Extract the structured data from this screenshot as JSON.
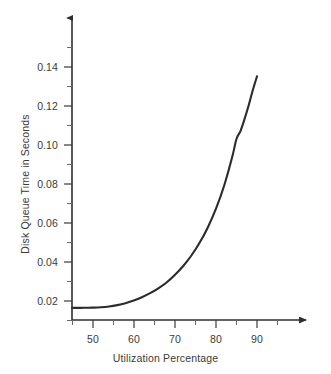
{
  "chart_data": {
    "type": "line",
    "title": "",
    "xlabel": "Utilization Percentage",
    "ylabel": "Disk Queue Time in Seconds",
    "xlim": [
      45,
      100
    ],
    "ylim": [
      0.0,
      0.155
    ],
    "grid": false,
    "legend": null,
    "x_ticks": [
      50,
      60,
      70,
      80,
      90
    ],
    "x_tick_labels": [
      "50",
      "60",
      "70",
      "80",
      "90"
    ],
    "x_minor_ticks": [
      45,
      55,
      65,
      75,
      85,
      95
    ],
    "y_ticks": [
      0.02,
      0.04,
      0.06,
      0.08,
      0.1,
      0.12,
      0.14
    ],
    "y_tick_labels": [
      "0.02",
      "0.04",
      "0.06",
      "0.08",
      "0.10",
      "0.12",
      "0.14"
    ],
    "y_minor_ticks": [
      0.01,
      0.03,
      0.05,
      0.07,
      0.09,
      0.11,
      0.13,
      0.15
    ],
    "series": [
      {
        "name": "Disk queue time",
        "color": "#2b2b2b",
        "x": [
          45,
          48,
          50,
          52,
          54,
          56,
          58,
          60,
          62,
          64,
          66,
          68,
          70,
          72,
          74,
          76,
          78,
          80,
          82,
          84,
          85,
          86,
          87,
          88,
          89,
          90
        ],
        "values": [
          0.0165,
          0.0165,
          0.0166,
          0.0168,
          0.0172,
          0.0179,
          0.0189,
          0.0202,
          0.0219,
          0.024,
          0.0265,
          0.0295,
          0.0333,
          0.0378,
          0.0432,
          0.0497,
          0.0576,
          0.0672,
          0.0791,
          0.0941,
          0.1031,
          0.1073,
          0.1135,
          0.1205,
          0.1283,
          0.1352
        ]
      }
    ]
  },
  "axis": {
    "x_arrow": "arrow-right",
    "y_arrow": "arrow-up"
  }
}
